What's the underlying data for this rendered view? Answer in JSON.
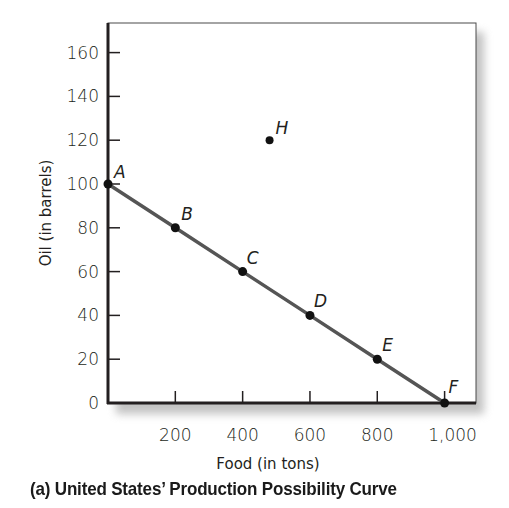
{
  "chart_data": {
    "type": "line",
    "xlabel": "Food (in tons)",
    "ylabel": "Oil (in barrels)",
    "xlim": [
      0,
      1050
    ],
    "ylim": [
      0,
      170
    ],
    "x_ticks": [
      "200",
      "400",
      "600",
      "800",
      "1,000"
    ],
    "y_ticks": [
      "0",
      "20",
      "40",
      "60",
      "80",
      "100",
      "120",
      "140",
      "160"
    ],
    "grid": false,
    "legend": null,
    "series": [
      {
        "name": "Production Possibility Curve",
        "color": "#555555",
        "points": [
          {
            "label": "A",
            "x": 0,
            "y": 100
          },
          {
            "label": "B",
            "x": 200,
            "y": 80
          },
          {
            "label": "C",
            "x": 400,
            "y": 60
          },
          {
            "label": "D",
            "x": 600,
            "y": 40
          },
          {
            "label": "E",
            "x": 800,
            "y": 20
          },
          {
            "label": "F",
            "x": 1000,
            "y": 0
          }
        ]
      }
    ],
    "annotations": [
      {
        "label": "H",
        "x": 480,
        "y": 120,
        "note": "unattainable point outside curve"
      }
    ]
  },
  "caption": "(a)  United States’ Production Possibility Curve"
}
